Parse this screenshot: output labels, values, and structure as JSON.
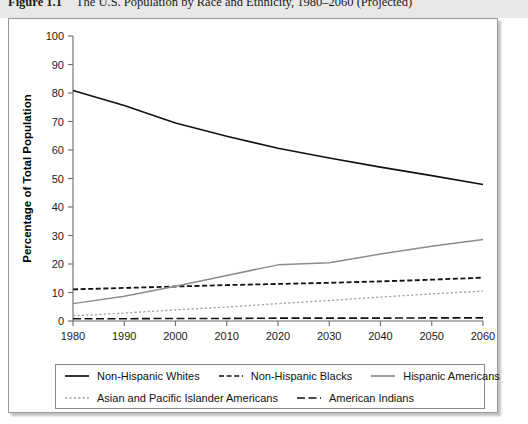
{
  "caption": {
    "label": "Figure 1.1",
    "text": "The U.S. Population by Race and Ethnicity, 1980–2060 (Projected)"
  },
  "chart_data": {
    "type": "line",
    "title": "The U.S. Population by Race and Ethnicity, 1980–2060 (Projected)",
    "xlabel": "",
    "ylabel": "Percentage of Total Population",
    "x": [
      1980,
      1990,
      2000,
      2010,
      2020,
      2030,
      2040,
      2050,
      2060
    ],
    "xtick_labels": [
      "1980",
      "1990",
      "2000",
      "2010",
      "2020",
      "2030",
      "2040",
      "2050",
      "2060"
    ],
    "ytick_labels": [
      "0",
      "10",
      "20",
      "30",
      "40",
      "50",
      "60",
      "70",
      "80",
      "90",
      "100"
    ],
    "ytick_values": [
      0,
      10,
      20,
      30,
      40,
      50,
      60,
      70,
      80,
      90,
      100
    ],
    "xlim": [
      1980,
      2060
    ],
    "ylim": [
      0,
      100
    ],
    "grid": false,
    "legend_position": "below",
    "series": [
      {
        "name": "Non-Hispanic Whites",
        "style": "solid",
        "color": "#111111",
        "width": 1.6,
        "values": [
          80.9,
          75.6,
          69.5,
          64.8,
          60.6,
          57.2,
          54.0,
          51.0,
          47.9
        ]
      },
      {
        "name": "Non-Hispanic  Blacks",
        "style": "dashed",
        "color": "#111111",
        "width": 1.8,
        "values": [
          11.1,
          11.6,
          12.1,
          12.6,
          13.0,
          13.4,
          13.9,
          14.5,
          15.2
        ]
      },
      {
        "name": "Hispanic Americans",
        "style": "solid",
        "color": "#8c8c8c",
        "width": 1.5,
        "values": [
          6.1,
          8.7,
          12.2,
          16.0,
          19.7,
          20.4,
          23.5,
          26.2,
          28.6
        ]
      },
      {
        "name": "Asian and Pacific Islander Americans",
        "style": "dotted",
        "color": "#a0a0a0",
        "width": 1.3,
        "values": [
          1.8,
          2.8,
          3.9,
          4.9,
          6.1,
          7.2,
          8.4,
          9.5,
          10.5
        ]
      },
      {
        "name": "American Indians",
        "style": "longdash",
        "color": "#111111",
        "width": 1.6,
        "values": [
          0.8,
          0.8,
          0.9,
          0.9,
          1.0,
          1.0,
          1.0,
          1.1,
          1.1
        ]
      }
    ]
  },
  "legend": {
    "rows": [
      [
        {
          "label": "Non-Hispanic Whites",
          "style": "solid",
          "color": "#111111"
        },
        {
          "label": "Non-Hispanic  Blacks",
          "style": "dashed",
          "color": "#111111"
        },
        {
          "label": "Hispanic Americans",
          "style": "solid",
          "color": "#8c8c8c"
        }
      ],
      [
        {
          "label": "Asian and Pacific Islander Americans",
          "style": "dotted",
          "color": "#a0a0a0"
        },
        {
          "label": "American Indians",
          "style": "longdash",
          "color": "#111111"
        }
      ]
    ]
  }
}
